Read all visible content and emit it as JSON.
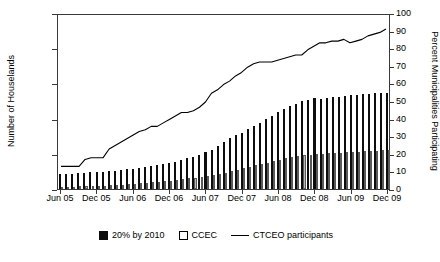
{
  "chart_data": {
    "type": "bar",
    "title": "",
    "xlabel": "",
    "ylabel": "Number of Houselands",
    "y2label": "Percent Municipalities Participating",
    "ylim": [
      0,
      25000
    ],
    "y2lim": [
      0,
      100
    ],
    "grid": false,
    "legend_position": "bottom",
    "y_ticks": [
      "0",
      "5,000",
      "10,000",
      "15,000",
      "20,000",
      "25,000"
    ],
    "y_tick_values": [
      0,
      5000,
      10000,
      15000,
      20000,
      25000
    ],
    "y2_ticks": [
      "0",
      "10",
      "20",
      "30",
      "40",
      "50",
      "60",
      "70",
      "80",
      "90",
      "100"
    ],
    "y2_tick_values": [
      0,
      10,
      20,
      30,
      40,
      50,
      60,
      70,
      80,
      90,
      100
    ],
    "x_tick_labels": [
      "Jun 05",
      "Dec 05",
      "Jun 06",
      "Dec 06",
      "Jun 07",
      "Dec 07",
      "Jun 08",
      "Dec 08",
      "Jun 09",
      "Dec 09"
    ],
    "x_tick_indices": [
      0,
      6,
      12,
      18,
      24,
      30,
      36,
      42,
      48,
      54
    ],
    "categories": [
      "Jun 05",
      "Jul 05",
      "Aug 05",
      "Sep 05",
      "Oct 05",
      "Nov 05",
      "Dec 05",
      "Jan 06",
      "Feb 06",
      "Mar 06",
      "Apr 06",
      "May 06",
      "Jun 06",
      "Jul 06",
      "Aug 06",
      "Sep 06",
      "Oct 06",
      "Nov 06",
      "Dec 06",
      "Jan 07",
      "Feb 07",
      "Mar 07",
      "Apr 07",
      "May 07",
      "Jun 07",
      "Jul 07",
      "Aug 07",
      "Sep 07",
      "Oct 07",
      "Nov 07",
      "Dec 07",
      "Jan 08",
      "Feb 08",
      "Mar 08",
      "Apr 08",
      "May 08",
      "Jun 08",
      "Jul 08",
      "Aug 08",
      "Sep 08",
      "Oct 08",
      "Nov 08",
      "Dec 08",
      "Jan 09",
      "Feb 09",
      "Mar 09",
      "Apr 09",
      "May 09",
      "Jun 09",
      "Jul 09",
      "Aug 09",
      "Sep 09",
      "Oct 09",
      "Nov 09",
      "Dec 09"
    ],
    "series": [
      {
        "name": "20% by 2010",
        "kind": "bar",
        "axis": "left",
        "color": "#0d0d0d",
        "values": [
          2100,
          2150,
          2200,
          2250,
          2300,
          2350,
          2400,
          2450,
          2500,
          2600,
          2700,
          2800,
          2900,
          3000,
          3150,
          3300,
          3450,
          3550,
          3700,
          3900,
          4100,
          4350,
          4600,
          4900,
          5200,
          5600,
          6100,
          6700,
          7300,
          7700,
          8000,
          8500,
          8900,
          9400,
          9900,
          10400,
          10900,
          11400,
          11800,
          12100,
          12500,
          12700,
          12900,
          12800,
          12900,
          13000,
          13100,
          13200,
          13300,
          13400,
          13500,
          13500,
          13600,
          13600,
          13700
        ]
      },
      {
        "name": "CCEC",
        "kind": "bar",
        "axis": "left",
        "color": "#b9b9b9",
        "values": [
          300,
          320,
          340,
          360,
          380,
          400,
          430,
          460,
          500,
          560,
          620,
          680,
          750,
          820,
          900,
          980,
          1050,
          1120,
          1200,
          1300,
          1400,
          1500,
          1600,
          1700,
          1800,
          1950,
          2100,
          2300,
          2550,
          2750,
          2950,
          3150,
          3350,
          3550,
          3750,
          3950,
          4150,
          4350,
          4500,
          4650,
          4800,
          4900,
          5000,
          5000,
          5050,
          5100,
          5150,
          5200,
          5250,
          5300,
          5350,
          5400,
          5450,
          5500,
          5600
        ]
      },
      {
        "name": "CTCEO participants",
        "kind": "line",
        "axis": "right",
        "color": "#000000",
        "values": [
          13,
          13,
          13,
          13,
          17,
          18,
          18,
          18,
          23,
          25,
          27,
          29,
          31,
          33,
          34,
          36,
          36,
          38,
          40,
          42,
          44,
          44,
          45,
          47,
          50,
          55,
          57,
          60,
          62,
          65,
          67,
          70,
          72,
          73,
          73,
          73,
          74,
          75,
          76,
          77,
          77,
          80,
          82,
          84,
          84,
          85,
          85,
          86,
          84,
          85,
          86,
          88,
          89,
          90,
          92
        ]
      }
    ]
  },
  "legend": {
    "items": [
      {
        "label": "20% by 2010",
        "marker": "filled-square-black"
      },
      {
        "label": "CCEC",
        "marker": "open-square"
      },
      {
        "label": "CTCEO participants",
        "marker": "line-segment"
      }
    ]
  },
  "colors": {
    "bar_black": "#0d0d0d",
    "bar_white": "#b9b9b9",
    "line": "#000000",
    "axis": "#3a3a3a",
    "background": "#ffffff"
  }
}
